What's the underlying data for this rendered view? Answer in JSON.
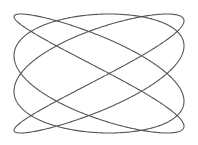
{
  "figure": {
    "kind": "lissajous-curve",
    "x_frequency": 4,
    "y_frequency": 3,
    "phase_shift_radians": 0.12,
    "line_color": "#555555",
    "background_color": "#ffffff"
  }
}
